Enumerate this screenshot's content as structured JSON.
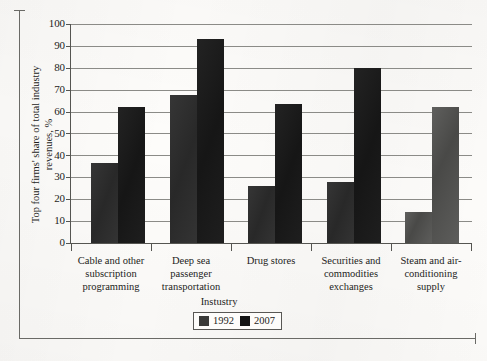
{
  "chart_data": {
    "type": "bar",
    "title": "",
    "xlabel": "Instustry",
    "ylabel": "Top four firms' share of total industry revenues, %",
    "ylabel_line1": "Top four firms' share of total industry",
    "ylabel_line2": "revenues, %",
    "ylim": [
      0,
      100
    ],
    "ytick_step": 10,
    "yticks": [
      "100",
      "90",
      "80",
      "70",
      "60",
      "50",
      "40",
      "30",
      "20",
      "10",
      "0"
    ],
    "grid": true,
    "legend_position": "bottom-center",
    "categories": [
      "Cable and other subscription programming",
      "Deep sea passenger transportation",
      "Drug stores",
      "Securities and commodities exchanges",
      "Steam and air-conditioning supply"
    ],
    "category_label_lines": [
      [
        "Cable and other",
        "subscription",
        "programming"
      ],
      [
        "Deep sea",
        "passenger",
        "transportation"
      ],
      [
        "Drug stores"
      ],
      [
        "Securities and",
        "commodities",
        "exchanges"
      ],
      [
        "Steam and air-",
        "conditioning",
        "supply"
      ]
    ],
    "series": [
      {
        "name": "1992",
        "color": "#2b2b2b",
        "values": [
          36.5,
          67.5,
          26,
          28,
          14
        ]
      },
      {
        "name": "2007",
        "color": "#171717",
        "values": [
          62,
          93,
          63.5,
          80,
          62
        ]
      }
    ]
  },
  "legend": {
    "items": [
      {
        "label": "1992",
        "color": "#3a3a38"
      },
      {
        "label": "2007",
        "color": "#141414"
      }
    ]
  }
}
